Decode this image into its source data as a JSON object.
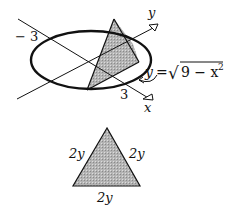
{
  "figure_top": {
    "axis_x_label": "x",
    "axis_y_label": "y",
    "label_neg3": "− 3",
    "label_3": "3",
    "equation": {
      "lhs": "y",
      "eq": "=",
      "radical": "√",
      "radicand": "9 − x",
      "exponent": "2"
    }
  },
  "figure_bottom": {
    "side_left": "2y",
    "side_right": "2y",
    "side_base": "2y"
  },
  "colors": {
    "stroke": "#111111",
    "shade": "#a8a8a8"
  }
}
